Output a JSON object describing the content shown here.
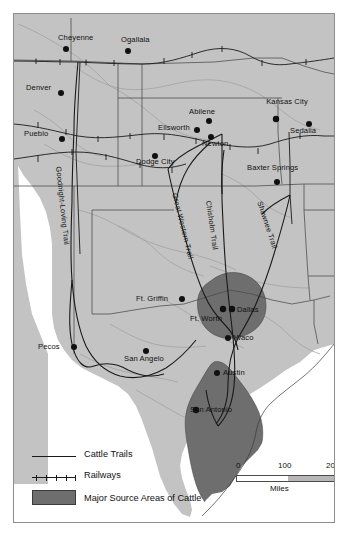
{
  "map": {
    "title": "Cattle Trails and Major Source Areas of Cattle",
    "colors": {
      "land": "#c3c3c3",
      "water": "#ffffff",
      "source_area": "#6e6e6e",
      "border": "#4a4a4a",
      "trail": "#1a1a1a",
      "river": "#9a9a9a",
      "text": "#111111"
    },
    "cities": [
      {
        "name": "Cheyenne",
        "x": 72,
        "y": 39,
        "dot_x": 65,
        "dot_y": 48,
        "align": "center"
      },
      {
        "name": "Ogallala",
        "x": 128,
        "y": 40,
        "dot_x": 127,
        "dot_y": 50,
        "align": "center"
      },
      {
        "name": "Denver",
        "x": 41,
        "y": 87,
        "dot_x": 60,
        "dot_y": 92,
        "align": "right"
      },
      {
        "name": "Abilene",
        "x": 196,
        "y": 112,
        "dot_x": 208,
        "dot_y": 120,
        "align": "center"
      },
      {
        "name": "Kansas City",
        "x": 277,
        "y": 96,
        "dot_x": 275,
        "dot_y": 118,
        "align": "center"
      },
      {
        "name": "Ellsworth",
        "x": 166,
        "y": 129,
        "dot_x": 196,
        "dot_y": 129,
        "align": "right"
      },
      {
        "name": "Sedalia",
        "x": 290,
        "y": 126,
        "dot_x": 308,
        "dot_y": 123,
        "align": "center"
      },
      {
        "name": "Pueblo",
        "x": 40,
        "y": 135,
        "dot_x": 61,
        "dot_y": 138,
        "align": "right"
      },
      {
        "name": "Newton",
        "x": 215,
        "y": 144,
        "dot_x": 210,
        "dot_y": 136,
        "align": "center"
      },
      {
        "name": "Baxter Springs",
        "x": 256,
        "y": 166,
        "dot_x": 276,
        "dot_y": 181,
        "align": "center"
      },
      {
        "name": "Dodge City",
        "x": 136,
        "y": 158,
        "dot_x": 154,
        "dot_y": 155,
        "align": "center"
      },
      {
        "name": "Ft. Griffin",
        "x": 143,
        "y": 297,
        "dot_x": 181,
        "dot_y": 298,
        "align": "right"
      },
      {
        "name": "Dallas",
        "x": 234,
        "y": 308,
        "dot_x": 231,
        "dot_y": 308,
        "align": "left"
      },
      {
        "name": "Ft. Worth",
        "x": 192,
        "y": 315,
        "dot_x": 222,
        "dot_y": 308,
        "align": "center"
      },
      {
        "name": "Waco",
        "x": 230,
        "y": 336,
        "dot_x": 227,
        "dot_y": 337,
        "align": "left"
      },
      {
        "name": "Pecos",
        "x": 44,
        "y": 348,
        "dot_x": 73,
        "dot_y": 346,
        "align": "right"
      },
      {
        "name": "San Angelo",
        "x": 136,
        "y": 357,
        "dot_x": 145,
        "dot_y": 350,
        "align": "center"
      },
      {
        "name": "Austin",
        "x": 221,
        "y": 371,
        "dot_x": 216,
        "dot_y": 372,
        "align": "left"
      },
      {
        "name": "San Antonio",
        "x": 199,
        "y": 410,
        "dot_x": 195,
        "dot_y": 409,
        "align": "center"
      }
    ],
    "trail_labels": [
      {
        "name": "Goodnight-Loving Trail",
        "x": 58,
        "y": 161,
        "rotate": 84
      },
      {
        "name": "Great Western Trail",
        "x": 176,
        "y": 187,
        "rotate": 76
      },
      {
        "name": "Chisholm Trail",
        "x": 210,
        "y": 196,
        "rotate": 82
      },
      {
        "name": "Shawnee Trail",
        "x": 261,
        "y": 196,
        "rotate": 72
      }
    ]
  },
  "legend": {
    "items": [
      {
        "label": "Cattle Trails",
        "symbol": "line-symbol"
      },
      {
        "label": "Railways",
        "symbol": "railway-symbol"
      },
      {
        "label": "Major Source Areas of Cattle",
        "symbol": "area-swatch"
      }
    ]
  },
  "scale": {
    "ticks": [
      "0",
      "100",
      "200"
    ],
    "unit": "Miles"
  }
}
